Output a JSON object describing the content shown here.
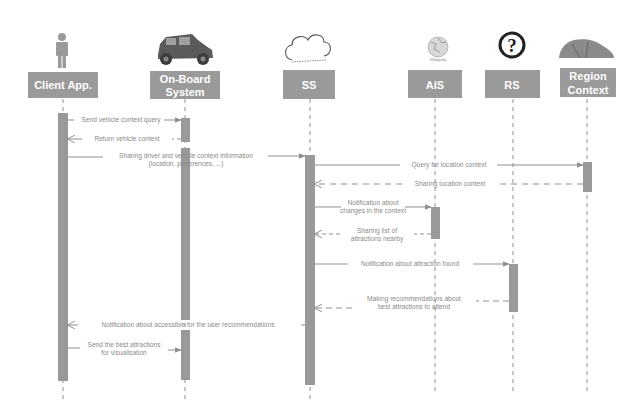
{
  "colors": {
    "header_fill": "#9a9a9a",
    "activation_fill": "#999999",
    "line": "#8f8f8f",
    "text": "#8a8a8a"
  },
  "participants": [
    {
      "id": "client",
      "label": [
        "Client App."
      ],
      "icon": "person-icon"
    },
    {
      "id": "obs",
      "label": [
        "On-Board",
        "System"
      ],
      "icon": "vintage-car-icon"
    },
    {
      "id": "ss",
      "label": [
        "SS"
      ],
      "icon": "cloud-icon"
    },
    {
      "id": "ais",
      "label": [
        "AIS"
      ],
      "icon": "wikipedia-globe-icon"
    },
    {
      "id": "rs",
      "label": [
        "RS"
      ],
      "icon": "question-mark-icon"
    },
    {
      "id": "region",
      "label": [
        "Region",
        "Context"
      ],
      "icon": "terrain-icon"
    }
  ],
  "messages": [
    {
      "from": "client",
      "to": "obs",
      "type": "sync",
      "label": [
        "Send vehicle context query"
      ]
    },
    {
      "from": "obs",
      "to": "client",
      "type": "return",
      "label": [
        "Return vehicle context"
      ]
    },
    {
      "from": "client",
      "to": "ss",
      "type": "sync",
      "label": [
        "Sharing driver and vehicle context information",
        "(location, preferences, ...)"
      ]
    },
    {
      "from": "ss",
      "to": "region",
      "type": "sync",
      "label": [
        "Query for location context"
      ]
    },
    {
      "from": "region",
      "to": "ss",
      "type": "return",
      "label": [
        "Sharing location context"
      ]
    },
    {
      "from": "ss",
      "to": "ais",
      "type": "sync",
      "label": [
        "Notification about",
        "changes in the context"
      ]
    },
    {
      "from": "ais",
      "to": "ss",
      "type": "return",
      "label": [
        "Sharing list of",
        "attractions nearby"
      ]
    },
    {
      "from": "ss",
      "to": "rs",
      "type": "sync",
      "label": [
        "Notification about attraction found"
      ]
    },
    {
      "from": "rs",
      "to": "ss",
      "type": "return",
      "label": [
        "Making recommendations about",
        "best attractions to attend"
      ]
    },
    {
      "from": "ss",
      "to": "client",
      "type": "return",
      "label": [
        "Notification about accessible for the user recommendations"
      ]
    },
    {
      "from": "client",
      "to": "obs",
      "type": "sync",
      "label": [
        "Send the best attractions",
        "for visualisation"
      ]
    }
  ]
}
